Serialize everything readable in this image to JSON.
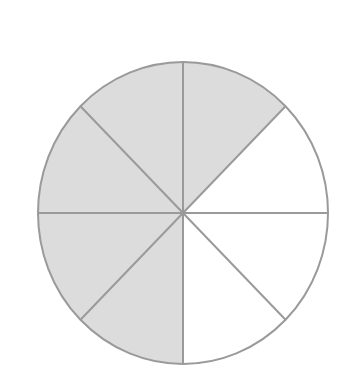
{
  "diagram": {
    "type": "fraction-circle",
    "total_parts": 8,
    "shaded_parts": 5,
    "fraction": "5/8",
    "colors": {
      "background": "#ffffff",
      "shaded_fill": "#dcdcdc",
      "unshaded_fill": "#ffffff",
      "stroke": "#9a9a9a"
    },
    "geometry": {
      "cx": 183,
      "cy": 213,
      "rx": 145,
      "ry": 151,
      "stroke_width": 2
    },
    "sectors": [
      {
        "index": 0,
        "position": "right-upper (0°-45°)",
        "shaded": false
      },
      {
        "index": 1,
        "position": "top-right (45°-90°)",
        "shaded": true
      },
      {
        "index": 2,
        "position": "top-left (90°-135°)",
        "shaded": true
      },
      {
        "index": 3,
        "position": "left-upper (135°-180°)",
        "shaded": true
      },
      {
        "index": 4,
        "position": "left-lower (180°-225°)",
        "shaded": true
      },
      {
        "index": 5,
        "position": "bottom-left (225°-270°)",
        "shaded": true
      },
      {
        "index": 6,
        "position": "bottom-right (270°-315°)",
        "shaded": false
      },
      {
        "index": 7,
        "position": "right-lower (315°-360°)",
        "shaded": false
      }
    ]
  }
}
